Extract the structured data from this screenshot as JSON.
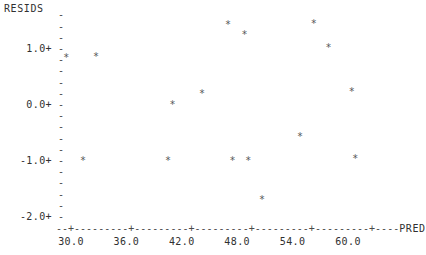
{
  "chart_data": {
    "type": "scatter",
    "title": "",
    "ylabel": "RESIDS",
    "xlabel": "PRED",
    "marker": "*",
    "grid": false,
    "legend": null,
    "xlim": [
      28.0,
      63.0
    ],
    "ylim": [
      -2.2,
      1.6
    ],
    "xticks": [
      "30.0",
      "36.0",
      "42.0",
      "48.0",
      "54.0",
      "60.0"
    ],
    "xtick_values": [
      30.0,
      36.0,
      42.0,
      48.0,
      54.0,
      60.0
    ],
    "yticks": [
      "1.0+",
      "0.0+",
      "-1.0+",
      "-2.0+"
    ],
    "ytick_values": [
      1.0,
      0.0,
      -1.0,
      -2.0
    ],
    "ytick_minor_count": 4,
    "points": [
      {
        "x": 29.5,
        "y": 0.84
      },
      {
        "x": 32.7,
        "y": 0.86
      },
      {
        "x": 31.3,
        "y": -1.0
      },
      {
        "x": 40.5,
        "y": -1.0
      },
      {
        "x": 41.0,
        "y": 0.0
      },
      {
        "x": 44.2,
        "y": 0.2
      },
      {
        "x": 47.0,
        "y": 1.43
      },
      {
        "x": 47.5,
        "y": -1.0
      },
      {
        "x": 48.8,
        "y": 1.25
      },
      {
        "x": 49.2,
        "y": -1.0
      },
      {
        "x": 50.7,
        "y": -1.7
      },
      {
        "x": 54.8,
        "y": -0.57
      },
      {
        "x": 56.3,
        "y": 1.45
      },
      {
        "x": 57.9,
        "y": 1.02
      },
      {
        "x": 60.4,
        "y": 0.23
      },
      {
        "x": 60.8,
        "y": -0.96
      }
    ]
  },
  "axis": {
    "y_title": "RESIDS",
    "x_name": "PRED",
    "x_axis_glyphs": "--+---------+---------+---------+---------+---------+----",
    "tick_glyph": "-",
    "marker_glyph": "*"
  },
  "colors": {
    "background": "#ffffff",
    "ink": "#303030",
    "marker": "#555555",
    "axis": "#4a4a4a"
  }
}
